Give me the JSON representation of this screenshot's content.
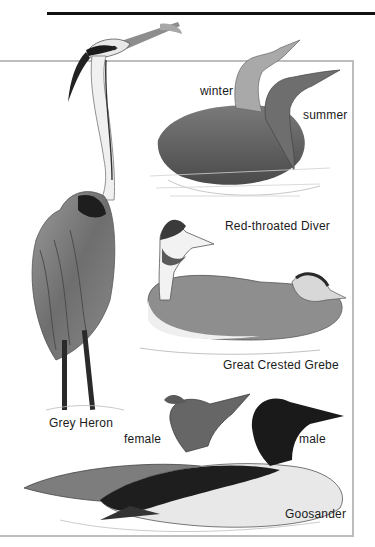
{
  "plate": {
    "labels": {
      "winter": "winter",
      "summer": "summer",
      "diver": "Red-throated Diver",
      "grebe": "Great Crested Grebe",
      "heron": "Grey Heron",
      "female": "female",
      "male": "male",
      "goosander": "Goosander"
    },
    "colors": {
      "rule": "#111111",
      "frame": "#bdbdbd",
      "ink": "#1a1a1a"
    }
  }
}
